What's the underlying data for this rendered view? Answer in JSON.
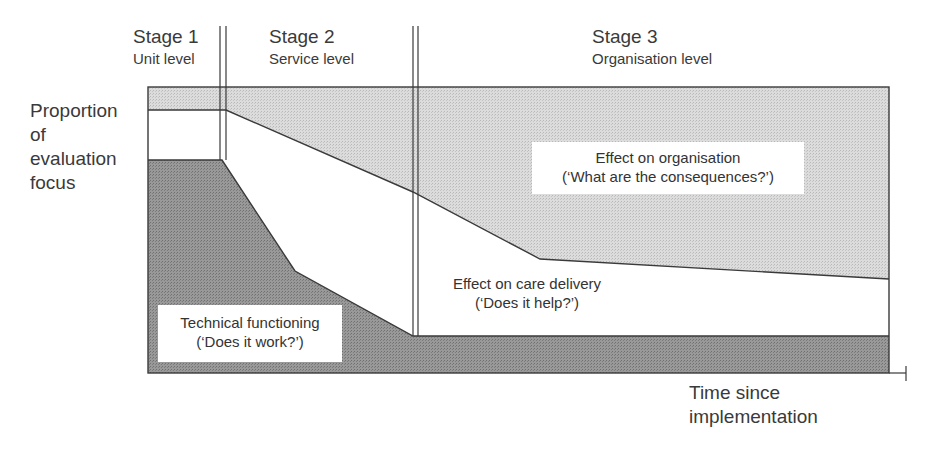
{
  "stages": [
    {
      "title": "Stage 1",
      "subtitle": "Unit level"
    },
    {
      "title": "Stage 2",
      "subtitle": "Service level"
    },
    {
      "title": "Stage 3",
      "subtitle": "Organisation level"
    }
  ],
  "axes": {
    "y_label": [
      "Proportion",
      "of",
      "evaluation",
      "focus"
    ],
    "x_label": [
      "Time since",
      "implementation"
    ]
  },
  "regions": {
    "organisation": {
      "line1": "Effect on organisation",
      "line2": "(‘What are the consequences?’)",
      "fill": "#d4d4d4"
    },
    "care_delivery": {
      "line1": "Effect on care delivery",
      "line2": "(‘Does it help?’)",
      "fill": "#ffffff"
    },
    "technical": {
      "line1": "Technical functioning",
      "line2": "(‘Does it work?’)",
      "fill": "#8f8f8f"
    }
  },
  "colors": {
    "line": "#3a3a3a",
    "light_fill": "#d4d4d4",
    "dark_fill": "#8f8f8f"
  }
}
